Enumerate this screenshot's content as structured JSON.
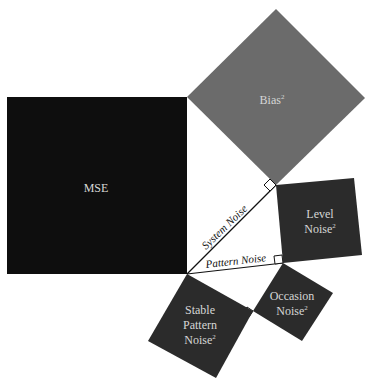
{
  "diagram": {
    "type": "pythagorean-decomposition",
    "colors": {
      "mse": "#0e0e0e",
      "bias": "#6b6b6b",
      "noise": "#2b2b2b",
      "label": "#d6d6d6",
      "line": "#111111"
    },
    "squares": {
      "mse": {
        "label": "MSE",
        "sup": ""
      },
      "bias": {
        "label": "Bias",
        "sup": "2"
      },
      "level_noise": {
        "line1": "Level",
        "line2": "Noise",
        "sup": "2"
      },
      "stable_pattern_noise": {
        "line1": "Stable",
        "line2": "Pattern",
        "line3": "Noise",
        "sup": "2"
      },
      "occasion_noise": {
        "line1": "Occasion",
        "line2": "Noise",
        "sup": "2"
      }
    },
    "edges": {
      "system_noise": "System Noise",
      "pattern_noise": "Pattern Noise"
    }
  }
}
